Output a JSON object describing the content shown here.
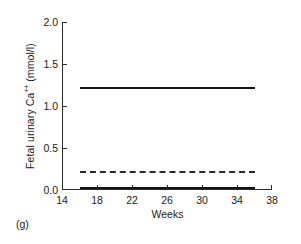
{
  "panel": {
    "label": "(g)"
  },
  "chart_data": {
    "type": "line",
    "title": "",
    "subtitle": "",
    "xlabel": "Weeks",
    "ylabel_plain": "Fetal urinary Ca++ (mmol/l)",
    "ylabel_prefix": "Fetal urinary Ca",
    "ylabel_superscript": "++",
    "ylabel_suffix": " (mmol/l)",
    "xlim": [
      14,
      38
    ],
    "ylim": [
      0.0,
      2.0
    ],
    "xticks": [
      14,
      18,
      22,
      26,
      30,
      34,
      38
    ],
    "yticks": [
      0.0,
      0.5,
      1.0,
      1.5,
      2.0
    ],
    "xticklabels": [
      "14",
      "18",
      "22",
      "26",
      "30",
      "34",
      "38"
    ],
    "yticklabels": [
      "0.0",
      "0.5",
      "1.0",
      "1.5",
      "2.0"
    ],
    "grid": false,
    "legend": "none",
    "x": [
      16,
      36
    ],
    "series": [
      {
        "name": "upper-limit",
        "style": "solid",
        "color": "#141414",
        "values": [
          1.21,
          1.21
        ]
      },
      {
        "name": "mean",
        "style": "dashed",
        "color": "#2a2a2a",
        "values": [
          0.21,
          0.21
        ]
      },
      {
        "name": "lower-limit",
        "style": "solid",
        "color": "#141414",
        "values": [
          0.02,
          0.02
        ]
      }
    ]
  }
}
